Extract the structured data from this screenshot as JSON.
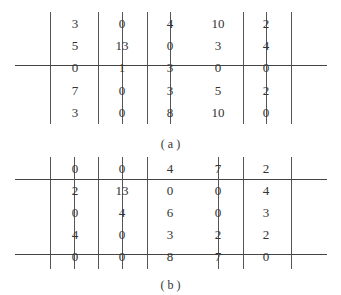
{
  "figures": [
    {
      "caption": "( a )",
      "matrix": [
        [
          "3",
          "0",
          "4",
          "10",
          "2"
        ],
        [
          "5",
          "13",
          "0",
          "3",
          "4"
        ],
        [
          "0",
          "1",
          "3",
          "0",
          "0"
        ],
        [
          "7",
          "0",
          "3",
          "5",
          "2"
        ],
        [
          "3",
          "0",
          "8",
          "10",
          "0"
        ]
      ],
      "covered_rows": [
        2
      ],
      "covered_cols": [
        1,
        2,
        4
      ]
    },
    {
      "caption": "( b )",
      "matrix": [
        [
          "0",
          "0",
          "4",
          "7",
          "2"
        ],
        [
          "2",
          "13",
          "0",
          "0",
          "4"
        ],
        [
          "0",
          "4",
          "6",
          "0",
          "3"
        ],
        [
          "4",
          "0",
          "3",
          "2",
          "2"
        ],
        [
          "0",
          "0",
          "8",
          "7",
          "0"
        ]
      ],
      "covered_rows": [
        0,
        4
      ],
      "covered_cols": [
        0,
        1,
        3
      ]
    }
  ]
}
